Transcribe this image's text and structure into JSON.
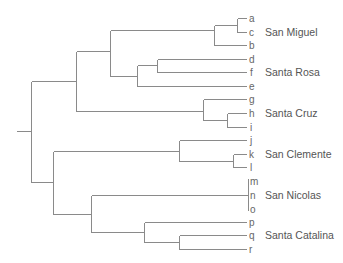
{
  "diagram": {
    "type": "dendrogram",
    "orientation": "left-to-right",
    "colors": {
      "line": "#8a8a8a",
      "leaf_text": "#666666",
      "group_text": "#555555",
      "background": "#ffffff"
    },
    "leaves": [
      {
        "id": "a",
        "label": "a",
        "y": 18
      },
      {
        "id": "c",
        "label": "c",
        "y": 32
      },
      {
        "id": "b",
        "label": "b",
        "y": 45
      },
      {
        "id": "d",
        "label": "d",
        "y": 59
      },
      {
        "id": "f",
        "label": "f",
        "y": 72
      },
      {
        "id": "e",
        "label": "e",
        "y": 86
      },
      {
        "id": "g",
        "label": "g",
        "y": 99
      },
      {
        "id": "h",
        "label": "h",
        "y": 113
      },
      {
        "id": "i",
        "label": "i",
        "y": 127
      },
      {
        "id": "j",
        "label": "j",
        "y": 140
      },
      {
        "id": "k",
        "label": "k",
        "y": 154
      },
      {
        "id": "l",
        "label": "l",
        "y": 167
      },
      {
        "id": "m",
        "label": "m",
        "y": 181
      },
      {
        "id": "n",
        "label": "n",
        "y": 195
      },
      {
        "id": "o",
        "label": "o",
        "y": 209
      },
      {
        "id": "p",
        "label": "p",
        "y": 222
      },
      {
        "id": "q",
        "label": "q",
        "y": 235
      },
      {
        "id": "r",
        "label": "r",
        "y": 249
      }
    ],
    "groups": [
      {
        "label": "San Miguel",
        "y": 32
      },
      {
        "label": "Santa Rosa",
        "y": 72
      },
      {
        "label": "Santa Cruz",
        "y": 113
      },
      {
        "label": "San Clemente",
        "y": 154
      },
      {
        "label": "San Nicolas",
        "y": 195
      },
      {
        "label": "Santa Catalina",
        "y": 235
      }
    ],
    "newick": "((((a,c),b),((d,f),e)),(g,(h,i))),((j,(k,l)),((m,n,o),(p,(q,r))));"
  }
}
